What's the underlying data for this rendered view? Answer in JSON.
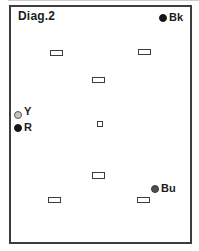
{
  "diagram": {
    "title": "Diag.2",
    "colors": {
      "ink": "#3d3d3d",
      "black_marker": "#161616",
      "dark_gray_marker": "#4f4f4f",
      "light_gray_marker": "#c4c4c4",
      "light_gray_ring": "#5a5a5a",
      "background": "#ffffff"
    },
    "markers": [
      {
        "id": "bk",
        "label": "Bk",
        "x": 152,
        "y": 9,
        "r": 4,
        "fill": "#161616",
        "stroke": "#161616",
        "label_dy": 0
      },
      {
        "id": "y",
        "label": "Y",
        "x": 7,
        "y": 106,
        "r": 4,
        "fill": "#c4c4c4",
        "stroke": "#5a5a5a",
        "label_dy": -3
      },
      {
        "id": "r",
        "label": "R",
        "x": 7,
        "y": 119,
        "r": 4,
        "fill": "#161616",
        "stroke": "#161616",
        "label_dy": 0
      },
      {
        "id": "bu",
        "label": "Bu",
        "x": 144,
        "y": 180,
        "r": 4,
        "fill": "#4f4f4f",
        "stroke": "#3a3a3a",
        "label_dy": 0
      }
    ],
    "slots": [
      {
        "x": 39,
        "y": 43,
        "w": 13,
        "h": 6
      },
      {
        "x": 127,
        "y": 42,
        "w": 13,
        "h": 6
      },
      {
        "x": 81,
        "y": 70,
        "w": 13,
        "h": 6
      },
      {
        "x": 86,
        "y": 114,
        "w": 6,
        "h": 6
      },
      {
        "x": 81,
        "y": 165,
        "w": 13,
        "h": 7
      },
      {
        "x": 37,
        "y": 190,
        "w": 13,
        "h": 6
      },
      {
        "x": 126,
        "y": 190,
        "w": 13,
        "h": 6
      }
    ]
  }
}
